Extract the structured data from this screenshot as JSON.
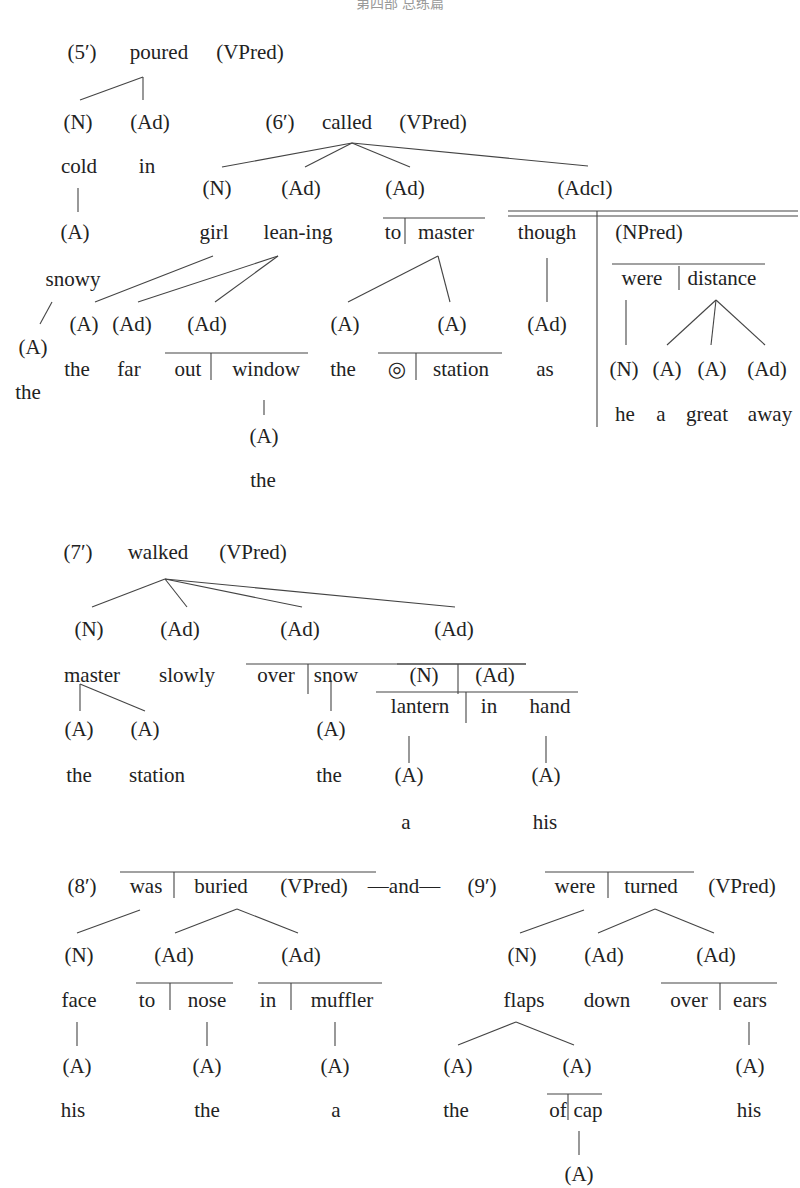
{
  "header": {
    "running_title": "第四部 总练篇"
  },
  "diagrams": [
    {
      "id": "5",
      "label": "(5′)",
      "root": {
        "word": "poured",
        "tag": "(VPred)"
      },
      "nodes": [
        {
          "tag": "(N)",
          "word": "cold",
          "children": [
            {
              "tag": "(A)",
              "word": "snowy",
              "children": [
                {
                  "tag": "(A)",
                  "word": "the"
                }
              ]
            }
          ]
        },
        {
          "tag": "(Ad)",
          "word": "in"
        }
      ]
    },
    {
      "id": "6",
      "label": "(6′)",
      "root": {
        "word": "called",
        "tag": "(VPred)"
      },
      "nodes": [
        {
          "tag": "(N)",
          "word": "girl",
          "children": [
            {
              "tag": "(A)",
              "word": "the"
            }
          ]
        },
        {
          "tag": "(Ad)",
          "word": "lean-ing",
          "children": [
            {
              "tag": "(Ad)",
              "word": "far"
            },
            {
              "tag": "(Ad)",
              "word": "out | window",
              "children": [
                {
                  "tag": "(A)",
                  "word": "the"
                }
              ]
            }
          ]
        },
        {
          "tag": "(Ad)",
          "word": "to | master",
          "children": [
            {
              "tag": "(A)",
              "word": "the"
            },
            {
              "tag": "(A)",
              "word": "◎ | station"
            }
          ]
        },
        {
          "tag": "(Adcl)",
          "connective": "though",
          "connective_child": {
            "tag": "(Ad)",
            "word": "as"
          },
          "clause": {
            "tag": "(NPred)",
            "word": "were | distance",
            "children": [
              {
                "tag": "(N)",
                "word": "he"
              },
              {
                "tag": "(A)",
                "word": "a"
              },
              {
                "tag": "(A)",
                "word": "great"
              },
              {
                "tag": "(Ad)",
                "word": "away"
              }
            ]
          }
        }
      ]
    },
    {
      "id": "7",
      "label": "(7′)",
      "root": {
        "word": "walked",
        "tag": "(VPred)"
      },
      "nodes": [
        {
          "tag": "(N)",
          "word": "master",
          "children": [
            {
              "tag": "(A)",
              "word": "the"
            },
            {
              "tag": "(A)",
              "word": "station"
            }
          ]
        },
        {
          "tag": "(Ad)",
          "word": "slowly"
        },
        {
          "tag": "(Ad)",
          "word": "over | snow",
          "children": [
            {
              "tag": "(A)",
              "word": "the"
            }
          ]
        },
        {
          "tag": "(Ad)",
          "word": "(N) | (Ad)",
          "sub": "lantern | in hand",
          "children": [
            {
              "tag": "(A)",
              "word": "a"
            },
            {
              "tag": "(A)",
              "word": "his"
            }
          ]
        }
      ]
    },
    {
      "id": "8",
      "label": "(8′)",
      "root": {
        "word": "was | buried",
        "tag": "(VPred)"
      },
      "conjunction": "—and—",
      "nodes": [
        {
          "tag": "(N)",
          "word": "face",
          "children": [
            {
              "tag": "(A)",
              "word": "his"
            }
          ]
        },
        {
          "tag": "(Ad)",
          "word": "to | nose",
          "children": [
            {
              "tag": "(A)",
              "word": "the"
            }
          ]
        },
        {
          "tag": "(Ad)",
          "word": "in | muffler",
          "children": [
            {
              "tag": "(A)",
              "word": "a"
            }
          ]
        }
      ]
    },
    {
      "id": "9",
      "label": "(9′)",
      "root": {
        "word": "were | turned",
        "tag": "(VPred)"
      },
      "nodes": [
        {
          "tag": "(N)",
          "word": "flaps",
          "children": [
            {
              "tag": "(A)",
              "word": "the"
            },
            {
              "tag": "(A)",
              "word": "of | cap",
              "children": [
                {
                  "tag": "(A)",
                  "word": ""
                }
              ]
            }
          ]
        },
        {
          "tag": "(Ad)",
          "word": "down"
        },
        {
          "tag": "(Ad)",
          "word": "over | ears",
          "children": [
            {
              "tag": "(A)",
              "word": "his"
            }
          ]
        }
      ]
    }
  ],
  "text": {
    "l5": "(5′)",
    "poured": "poured",
    "vpred": "(VPred)",
    "n": "(N)",
    "ad": "(Ad)",
    "a": "(A)",
    "adcl": "(Adcl)",
    "npred": "(NPred)",
    "cold": "cold",
    "in": "in",
    "snowy": "snowy",
    "the": "the",
    "l6": "(6′)",
    "called": "called",
    "girl": "girl",
    "leaning": "lean-ing",
    "to": "to",
    "master": "master",
    "though": "though",
    "were": "were",
    "distance": "distance",
    "far": "far",
    "out": "out",
    "window": "window",
    "circle": "◎",
    "station": "station",
    "as": "as",
    "he": "he",
    "a_w": "a",
    "great": "great",
    "away": "away",
    "l7": "(7′)",
    "walked": "walked",
    "slowly": "slowly",
    "over": "over",
    "snow": "snow",
    "lantern": "lantern",
    "hand": "hand",
    "his": "his",
    "l8": "(8′)",
    "was": "was",
    "buried": "buried",
    "and": "—and—",
    "face": "face",
    "nose": "nose",
    "muffler": "muffler",
    "l9": "(9′)",
    "turned": "turned",
    "flaps": "flaps",
    "down": "down",
    "ears": "ears",
    "of": "of",
    "cap": "cap"
  }
}
